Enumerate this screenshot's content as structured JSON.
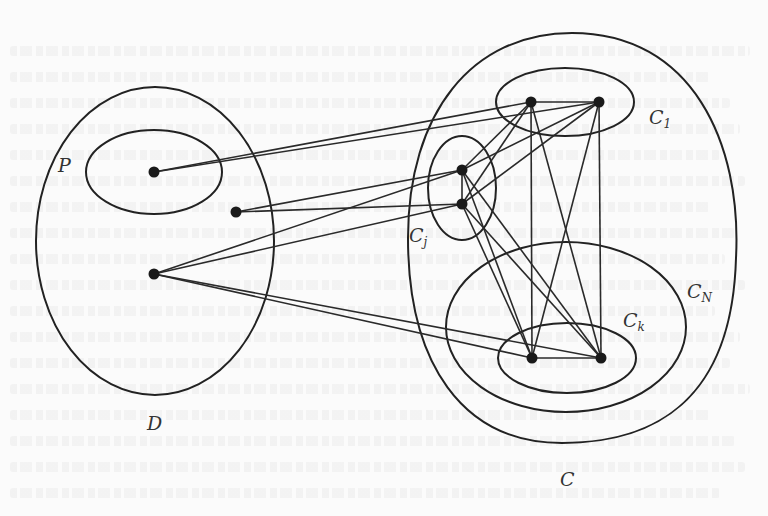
{
  "figure": {
    "type": "graph-diagram",
    "sets": [
      {
        "id": "D",
        "label": "D",
        "cx": 155,
        "cy": 241,
        "rx": 119,
        "ry": 154
      },
      {
        "id": "P",
        "label": "P",
        "cx": 154,
        "cy": 172,
        "rx": 68,
        "ry": 42
      },
      {
        "id": "C",
        "label": "C",
        "cx": 572,
        "cy": 238,
        "rx": 164,
        "ry": 205
      },
      {
        "id": "C1",
        "label": "C",
        "sub": "1",
        "cx": 565,
        "cy": 102,
        "rx": 69,
        "ry": 34
      },
      {
        "id": "Cj",
        "label": "C",
        "sub": "j",
        "cx": 462,
        "cy": 188,
        "rx": 34,
        "ry": 52
      },
      {
        "id": "CN",
        "label": "C",
        "sub": "N",
        "cx": 566,
        "cy": 327,
        "rx": 120,
        "ry": 85
      },
      {
        "id": "Ck",
        "label": "C",
        "sub": "k",
        "cx": 567,
        "cy": 358,
        "rx": 69,
        "ry": 35
      }
    ],
    "labels": {
      "P": "P",
      "D": "D",
      "C": "C",
      "C1_main": "C",
      "C1_sub": "1",
      "Cj_main": "C",
      "Cj_sub": "j",
      "CN_main": "C",
      "CN_sub": "N",
      "Ck_main": "C",
      "Ck_sub": "k"
    },
    "vertices": [
      {
        "id": "p",
        "set": "P",
        "x": 154,
        "y": 172
      },
      {
        "id": "d1",
        "set": "D",
        "x": 236,
        "y": 212
      },
      {
        "id": "d2",
        "set": "D",
        "x": 154,
        "y": 274
      },
      {
        "id": "c1a",
        "set": "C1",
        "x": 531,
        "y": 102
      },
      {
        "id": "c1b",
        "set": "C1",
        "x": 599,
        "y": 102
      },
      {
        "id": "cja",
        "set": "Cj",
        "x": 462,
        "y": 170
      },
      {
        "id": "cjb",
        "set": "Cj",
        "x": 462,
        "y": 204
      },
      {
        "id": "cka",
        "set": "Ck",
        "x": 532,
        "y": 358
      },
      {
        "id": "ckb",
        "set": "Ck",
        "x": 601,
        "y": 358
      }
    ],
    "edges": [
      [
        "p",
        "c1a"
      ],
      [
        "p",
        "c1b"
      ],
      [
        "d1",
        "cja"
      ],
      [
        "d1",
        "cjb"
      ],
      [
        "d2",
        "cja"
      ],
      [
        "d2",
        "cjb"
      ],
      [
        "d2",
        "cka"
      ],
      [
        "d2",
        "ckb"
      ],
      [
        "c1a",
        "c1b"
      ],
      [
        "c1a",
        "cja"
      ],
      [
        "c1a",
        "cjb"
      ],
      [
        "c1b",
        "cja"
      ],
      [
        "c1b",
        "cjb"
      ],
      [
        "c1a",
        "cka"
      ],
      [
        "c1a",
        "ckb"
      ],
      [
        "c1b",
        "cka"
      ],
      [
        "c1b",
        "ckb"
      ],
      [
        "cja",
        "cjb"
      ],
      [
        "cja",
        "cka"
      ],
      [
        "cja",
        "ckb"
      ],
      [
        "cjb",
        "cka"
      ],
      [
        "cjb",
        "ckb"
      ],
      [
        "cka",
        "ckb"
      ]
    ]
  }
}
